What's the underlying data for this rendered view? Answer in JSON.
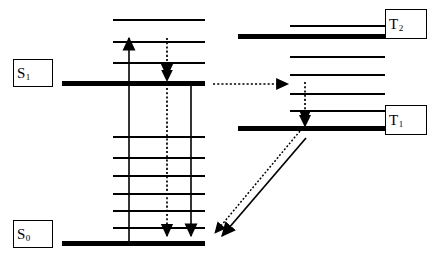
{
  "diagram": {
    "type": "jablonski-energy-diagram",
    "width": 443,
    "height": 269,
    "background_color": "#ffffff",
    "line_color": "#000000",
    "labels": [
      {
        "id": "S1",
        "base": "S",
        "sub": "1",
        "text": "S1",
        "meaning": "first-excited-singlet-state"
      },
      {
        "id": "S0",
        "base": "S",
        "sub": "0",
        "text": "S0",
        "meaning": "ground-singlet-state"
      },
      {
        "id": "T2",
        "base": "T",
        "sub": "2",
        "text": "T2",
        "meaning": "second-triplet-state"
      },
      {
        "id": "T1",
        "base": "T",
        "sub": "1",
        "text": "T1",
        "meaning": "first-triplet-state"
      }
    ],
    "electronic_levels": [
      {
        "id": "S1",
        "label": "S1",
        "x1": 62,
        "x2": 205,
        "y": 83,
        "thickness": 5
      },
      {
        "id": "S0",
        "label": "S0",
        "x1": 62,
        "x2": 205,
        "y": 243,
        "thickness": 5
      },
      {
        "id": "T2",
        "label": "T2",
        "x1": 238,
        "x2": 385,
        "y": 36,
        "thickness": 5
      },
      {
        "id": "T1",
        "label": "T1",
        "x1": 238,
        "x2": 385,
        "y": 128,
        "thickness": 5
      }
    ],
    "vibrational_levels": {
      "singlet_excited": {
        "x1": 113,
        "x2": 205,
        "thickness": 1,
        "y_values": [
          20,
          42,
          63
        ]
      },
      "singlet_ground": {
        "x1": 113,
        "x2": 205,
        "thickness": 1,
        "y_values": [
          137,
          158,
          176,
          194,
          211,
          228
        ]
      },
      "triplet": {
        "x1": 290,
        "x2": 385,
        "thickness": 1,
        "y_values": [
          26,
          57,
          75,
          94,
          111
        ]
      }
    },
    "transitions": [
      {
        "id": "absorption",
        "name": "absorption",
        "style": "solid",
        "direction": "up",
        "x1": 129,
        "y1": 243,
        "x2": 129,
        "y2": 36,
        "arrowhead": "end"
      },
      {
        "id": "internal-conversion",
        "name": "internal-conversion-vibrational-relaxation",
        "style": "dotted",
        "direction": "down",
        "x1": 167,
        "y1": 36,
        "x2": 167,
        "y2": 243,
        "arrowhead": "end",
        "mid_arrowhead_y": 78
      },
      {
        "id": "fluorescence",
        "name": "fluorescence",
        "style": "solid",
        "direction": "down",
        "x1": 191,
        "y1": 83,
        "x2": 191,
        "y2": 243,
        "arrowhead": "end"
      },
      {
        "id": "intersystem-crossing",
        "name": "intersystem-crossing-S1-to-T",
        "style": "dotted",
        "direction": "right",
        "x1": 213,
        "y1": 84,
        "x2": 292,
        "y2": 84,
        "arrowhead": "end"
      },
      {
        "id": "triplet-relaxation",
        "name": "triplet-vibrational-relaxation",
        "style": "dotted",
        "direction": "down",
        "x1": 305,
        "y1": 84,
        "x2": 305,
        "y2": 128,
        "arrowhead": "end"
      },
      {
        "id": "reverse-intersystem-crossing",
        "name": "nonradiative-decay-T1-to-S0",
        "style": "dotted",
        "direction": "down-left",
        "x1": 300,
        "y1": 131,
        "x2": 211,
        "y2": 238,
        "arrowhead": "end"
      },
      {
        "id": "phosphorescence",
        "name": "phosphorescence",
        "style": "solid",
        "direction": "down-left",
        "x1": 305,
        "y1": 137,
        "x2": 217,
        "y2": 240,
        "arrowhead": "end"
      }
    ]
  }
}
